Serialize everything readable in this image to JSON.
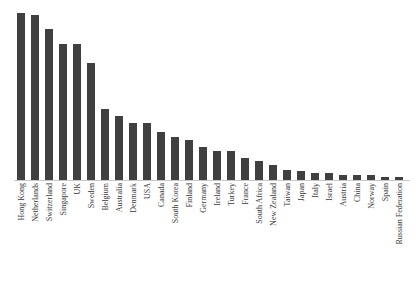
{
  "chart_data": {
    "type": "bar",
    "title": "",
    "subtitle": "",
    "xlabel": "",
    "ylabel": "",
    "grid": false,
    "legend": false,
    "legend_position": "none",
    "orientation": "vertical",
    "tick_label_rotation": -90,
    "bar_color": "#404040",
    "axis_color": "#c8c8c8",
    "background_color": "#ffffff",
    "ylim": [
      0,
      100
    ],
    "y_axis_visible": false,
    "y_ticks": [],
    "categories": [
      "Hong Kong",
      "Netherlands",
      "Switzerland",
      "Singapore",
      "UK",
      "Sweden",
      "Belgium",
      "Australia",
      "Denmark",
      "USA",
      "Canada",
      "South Korea",
      "Finland",
      "Germany",
      "Ireland",
      "Turkey",
      "France",
      "South Africa",
      "New Zealand",
      "Taiwan",
      "Japan",
      "Italy",
      "Israel",
      "Austria",
      "China",
      "Norway",
      "Spain",
      "Russian Federation"
    ],
    "values": [
      97,
      96,
      88,
      79,
      79,
      68,
      41,
      37,
      33,
      33,
      28,
      25,
      23,
      19,
      17,
      17,
      13,
      11,
      9,
      6,
      5,
      4,
      4,
      3,
      3,
      3,
      2,
      2
    ]
  }
}
